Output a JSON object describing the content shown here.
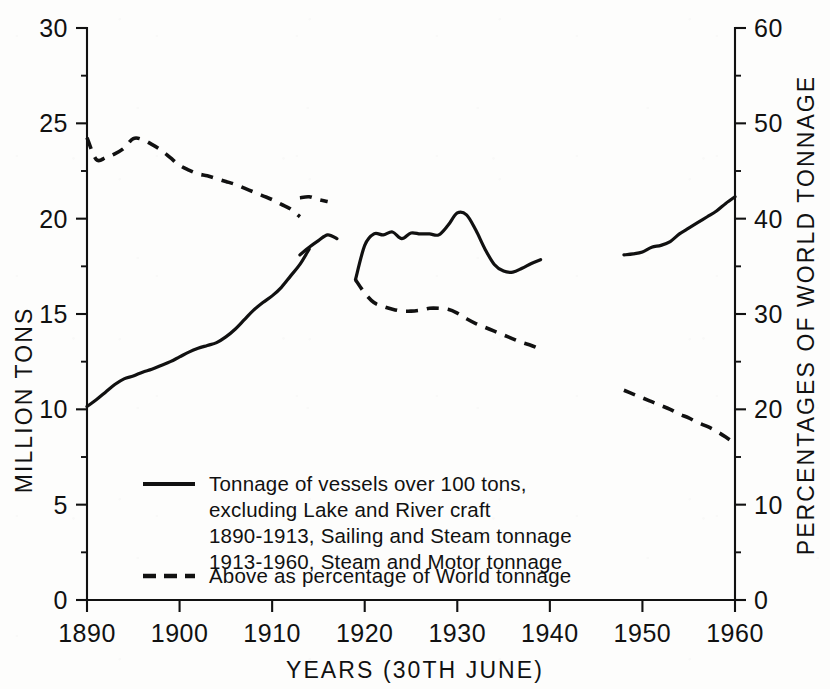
{
  "chart_data": {
    "type": "line",
    "title": "",
    "xlabel": "YEARS (30TH JUNE)",
    "ylabel": "MILLION TONS",
    "y2label": "PERCENTAGES OF WORLD TONNAGE",
    "xlim": [
      1890,
      1960
    ],
    "ylim": [
      0,
      30
    ],
    "y2lim": [
      0,
      60
    ],
    "grid": false,
    "legend_position": "inside-lower-left",
    "x_ticks": [
      "1890",
      "1900",
      "1910",
      "1920",
      "1930",
      "1940",
      "1950",
      "1960"
    ],
    "x_tick_values": [
      1890,
      1900,
      1910,
      1920,
      1930,
      1940,
      1950,
      1960
    ],
    "y_ticks": [
      "0",
      "5",
      "10",
      "15",
      "20",
      "25",
      "30"
    ],
    "y_tick_values": [
      0,
      5,
      10,
      15,
      20,
      25,
      30
    ],
    "y2_ticks": [
      "0",
      "10",
      "20",
      "30",
      "40",
      "50",
      "60"
    ],
    "y2_tick_values": [
      0,
      10,
      20,
      30,
      40,
      50,
      60
    ],
    "series": [
      {
        "name": "Tonnage of vessels over 100 tons (million tons)",
        "style": "solid",
        "axis": "left",
        "segments": [
          {
            "label": "1890-1913 Sailing and Steam tonnage",
            "points": [
              [
                1890,
                10.15
              ],
              [
                1891,
                10.5
              ],
              [
                1892,
                10.9
              ],
              [
                1893,
                11.3
              ],
              [
                1894,
                11.6
              ],
              [
                1895,
                11.75
              ],
              [
                1896,
                11.95
              ],
              [
                1897,
                12.1
              ],
              [
                1898,
                12.3
              ],
              [
                1899,
                12.5
              ],
              [
                1900,
                12.75
              ],
              [
                1901,
                13.0
              ],
              [
                1902,
                13.2
              ],
              [
                1903,
                13.35
              ],
              [
                1904,
                13.5
              ],
              [
                1905,
                13.8
              ],
              [
                1906,
                14.2
              ],
              [
                1907,
                14.7
              ],
              [
                1908,
                15.2
              ],
              [
                1909,
                15.6
              ],
              [
                1910,
                15.95
              ],
              [
                1911,
                16.4
              ],
              [
                1912,
                17.0
              ],
              [
                1913,
                17.6
              ],
              [
                1914,
                18.4
              ]
            ]
          },
          {
            "label": "1913-1916 Steam and Motor tonnage",
            "points": [
              [
                1913,
                18.1
              ],
              [
                1914,
                18.5
              ],
              [
                1915,
                18.85
              ],
              [
                1916,
                19.15
              ],
              [
                1917,
                18.95
              ]
            ]
          },
          {
            "label": "1919-1939 Steam and Motor tonnage",
            "points": [
              [
                1919,
                16.8
              ],
              [
                1920,
                18.6
              ],
              [
                1921,
                19.2
              ],
              [
                1922,
                19.15
              ],
              [
                1923,
                19.3
              ],
              [
                1924,
                18.95
              ],
              [
                1925,
                19.25
              ],
              [
                1926,
                19.2
              ],
              [
                1927,
                19.2
              ],
              [
                1928,
                19.15
              ],
              [
                1929,
                19.65
              ],
              [
                1930,
                20.3
              ],
              [
                1931,
                20.2
              ],
              [
                1932,
                19.4
              ],
              [
                1933,
                18.4
              ],
              [
                1934,
                17.6
              ],
              [
                1935,
                17.25
              ],
              [
                1936,
                17.2
              ],
              [
                1937,
                17.4
              ],
              [
                1938,
                17.65
              ],
              [
                1939,
                17.85
              ]
            ]
          },
          {
            "label": "1948-1960 Steam and Motor tonnage",
            "points": [
              [
                1948,
                18.1
              ],
              [
                1949,
                18.15
              ],
              [
                1950,
                18.25
              ],
              [
                1951,
                18.5
              ],
              [
                1952,
                18.6
              ],
              [
                1953,
                18.8
              ],
              [
                1954,
                19.2
              ],
              [
                1955,
                19.5
              ],
              [
                1956,
                19.8
              ],
              [
                1957,
                20.1
              ],
              [
                1958,
                20.4
              ],
              [
                1959,
                20.8
              ],
              [
                1960,
                21.15
              ]
            ]
          }
        ]
      },
      {
        "name": "Above as percentage of World tonnage",
        "style": "dashed",
        "axis": "right",
        "segments": [
          {
            "label": "1890-1913 percentage of world tonnage",
            "points": [
              [
                1890,
                48.5
              ],
              [
                1891,
                46.2
              ],
              [
                1892,
                46.4
              ],
              [
                1893,
                46.8
              ],
              [
                1894,
                47.4
              ],
              [
                1895,
                48.4
              ],
              [
                1896,
                48.3
              ],
              [
                1897,
                47.8
              ],
              [
                1898,
                47.2
              ],
              [
                1899,
                46.4
              ],
              [
                1900,
                45.6
              ],
              [
                1901,
                45.1
              ],
              [
                1902,
                44.7
              ],
              [
                1903,
                44.5
              ],
              [
                1904,
                44.2
              ],
              [
                1905,
                43.9
              ],
              [
                1906,
                43.6
              ],
              [
                1907,
                43.2
              ],
              [
                1908,
                42.8
              ],
              [
                1909,
                42.4
              ],
              [
                1910,
                42.0
              ],
              [
                1911,
                41.5
              ],
              [
                1912,
                41.0
              ],
              [
                1913,
                40.2
              ]
            ]
          },
          {
            "label": "1913-1916 percentage of world tonnage",
            "points": [
              [
                1913,
                42.2
              ],
              [
                1914,
                42.3
              ],
              [
                1915,
                42.0
              ],
              [
                1916,
                41.8
              ]
            ]
          },
          {
            "label": "1919-1939 percentage of world tonnage",
            "points": [
              [
                1919,
                33.6
              ],
              [
                1920,
                32.2
              ],
              [
                1921,
                31.2
              ],
              [
                1922,
                30.8
              ],
              [
                1923,
                30.5
              ],
              [
                1924,
                30.3
              ],
              [
                1925,
                30.3
              ],
              [
                1926,
                30.4
              ],
              [
                1927,
                30.6
              ],
              [
                1928,
                30.6
              ],
              [
                1929,
                30.5
              ],
              [
                1930,
                30.1
              ],
              [
                1931,
                29.5
              ],
              [
                1932,
                29.0
              ],
              [
                1933,
                28.6
              ],
              [
                1934,
                28.2
              ],
              [
                1935,
                27.8
              ],
              [
                1936,
                27.4
              ],
              [
                1937,
                27.0
              ],
              [
                1938,
                26.7
              ],
              [
                1939,
                26.3
              ]
            ]
          },
          {
            "label": "1948-1960 percentage of world tonnage",
            "points": [
              [
                1948,
                22.0
              ],
              [
                1949,
                21.6
              ],
              [
                1950,
                21.2
              ],
              [
                1951,
                20.8
              ],
              [
                1952,
                20.4
              ],
              [
                1953,
                20.0
              ],
              [
                1954,
                19.5
              ],
              [
                1955,
                19.1
              ],
              [
                1956,
                18.6
              ],
              [
                1957,
                18.2
              ],
              [
                1958,
                17.7
              ],
              [
                1959,
                17.1
              ],
              [
                1960,
                16.4
              ]
            ]
          }
        ]
      }
    ]
  },
  "axes": {
    "left_title": "MILLION TONS",
    "right_title": "PERCENTAGES OF WORLD TONNAGE",
    "bottom_title": "YEARS (30TH JUNE)"
  },
  "legend": {
    "entries": [
      {
        "swatch": "solid-line",
        "lines": [
          "Tonnage of vessels over 100 tons,",
          "excluding Lake and River craft",
          "1890-1913, Sailing and Steam tonnage",
          "1913-1960, Steam and Motor tonnage"
        ]
      },
      {
        "swatch": "dashed-line",
        "lines": [
          "Above as percentage of  World tonnage"
        ]
      }
    ]
  },
  "colors": {
    "ink": "#111111",
    "paper": "#fdfdfc"
  }
}
